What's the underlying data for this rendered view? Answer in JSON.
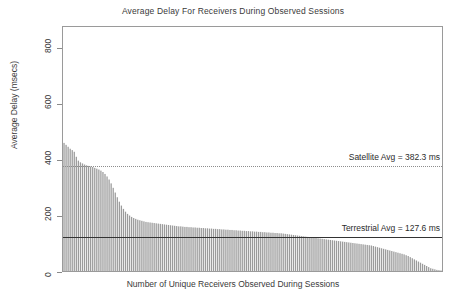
{
  "chart_data": {
    "type": "bar",
    "title": "Average Delay For Receivers During Observed Sessions",
    "xlabel": "Number of Unique Receivers Observed During Sessions",
    "ylabel": "Average Delay (msecs)",
    "ylim": [
      0,
      880
    ],
    "yticks": [
      0,
      200,
      400,
      600,
      800
    ],
    "ytick_labels": [
      "0",
      "200",
      "400",
      "600",
      "800"
    ],
    "xticks": [],
    "grid": false,
    "legend": null,
    "bar_color": "#9b9b9b",
    "series_name": "Average delay per receiver (sorted descending)",
    "n_bars": 185,
    "values": [
      462,
      455,
      448,
      441,
      436,
      430,
      412,
      398,
      392,
      388,
      384,
      381,
      379,
      377,
      375,
      372,
      369,
      366,
      362,
      357,
      350,
      341,
      330,
      316,
      300,
      283,
      266,
      250,
      236,
      224,
      214,
      206,
      200,
      195,
      191,
      188,
      185,
      183,
      181,
      179,
      177,
      176,
      175,
      174,
      173,
      172,
      171,
      170,
      169,
      168,
      167,
      166,
      165,
      164,
      163,
      162,
      161,
      161,
      160,
      159,
      159,
      158,
      158,
      157,
      157,
      156,
      156,
      155,
      155,
      154,
      154,
      153,
      153,
      152,
      152,
      151,
      151,
      150,
      150,
      149,
      149,
      148,
      148,
      147,
      147,
      146,
      146,
      145,
      145,
      144,
      144,
      143,
      143,
      142,
      142,
      141,
      141,
      140,
      140,
      139,
      139,
      138,
      138,
      137,
      137,
      136,
      136,
      135,
      134,
      133,
      132,
      131,
      130,
      129,
      128,
      127,
      126,
      125,
      124,
      123,
      122,
      121,
      120,
      119,
      118,
      117,
      116,
      115,
      114,
      113,
      112,
      111,
      110,
      109,
      108,
      107,
      106,
      105,
      104,
      103,
      102,
      101,
      100,
      99,
      98,
      97,
      96,
      95,
      94,
      93,
      92,
      90,
      88,
      86,
      84,
      82,
      80,
      78,
      76,
      74,
      72,
      70,
      68,
      66,
      64,
      62,
      60,
      57,
      54,
      50,
      46,
      42,
      38,
      34,
      30,
      26,
      22,
      18,
      14,
      10,
      8,
      6,
      4,
      3,
      2
    ],
    "reference_lines": [
      {
        "name": "satellite-average",
        "label": "Satellite Avg = 382.3 ms",
        "value": 382.3,
        "style": "dotted",
        "color": "#8d8d8d"
      },
      {
        "name": "terrestrial-average",
        "label": "Terrestrial Avg = 127.6 ms",
        "value": 127.6,
        "style": "solid",
        "color": "#333333"
      }
    ]
  },
  "annotations": {
    "satellite": "Satellite Avg = 382.3 ms",
    "terrestrial": "Terrestrial Avg = 127.6 ms"
  }
}
